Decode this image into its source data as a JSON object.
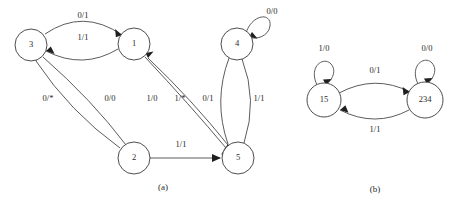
{
  "figure": {
    "background_color": "#ffffff",
    "stroke_color": "#4a4a4a",
    "text_color": "#2b2b2b"
  },
  "panels": [
    {
      "id": "panel-a",
      "caption": "(a)",
      "caption_x": 163,
      "caption_y": 188,
      "nodes": [
        {
          "id": "n3",
          "label": "3",
          "cx": 31,
          "cy": 45,
          "r": 16
        },
        {
          "id": "n1",
          "label": "1",
          "cx": 134,
          "cy": 44,
          "r": 16
        },
        {
          "id": "n4",
          "label": "4",
          "cx": 237,
          "cy": 44,
          "r": 16
        },
        {
          "id": "n2",
          "label": "2",
          "cx": 134,
          "cy": 158,
          "r": 16
        },
        {
          "id": "n5",
          "label": "5",
          "cx": 238,
          "cy": 158,
          "r": 16
        }
      ],
      "edges": [
        {
          "id": "e-3-1-top",
          "from": "3",
          "to": "1",
          "label": "0/1",
          "label_x": 83,
          "label_y": 16
        },
        {
          "id": "e-1-3-mid",
          "from": "1",
          "to": "3",
          "label": "1/1",
          "label_x": 83,
          "label_y": 38
        },
        {
          "id": "e-2-3",
          "from": "2",
          "to": "3",
          "label": "0/*",
          "label_x": 48,
          "label_y": 99
        },
        {
          "id": "e-3-2",
          "from": "3",
          "to": "2",
          "label": "0/0",
          "label_x": 110,
          "label_y": 99
        },
        {
          "id": "e-1-5",
          "from": "1",
          "to": "5",
          "label": "1/0",
          "label_x": 152,
          "label_y": 99
        },
        {
          "id": "e-5-1",
          "from": "5",
          "to": "1",
          "label": "1/*",
          "label_x": 180,
          "label_y": 99
        },
        {
          "id": "e-4-5-left",
          "from": "4",
          "to": "5",
          "label": "0/1",
          "label_x": 208,
          "label_y": 99
        },
        {
          "id": "e-5-4-right",
          "from": "5",
          "to": "4",
          "label": "1/1",
          "label_x": 259,
          "label_y": 99
        },
        {
          "id": "e-2-5",
          "from": "2",
          "to": "5",
          "label": "1/1",
          "label_x": 181,
          "label_y": 145
        },
        {
          "id": "e-4-4-self",
          "from": "4",
          "to": "4",
          "label": "0/0",
          "label_x": 272,
          "label_y": 12
        }
      ]
    },
    {
      "id": "panel-b",
      "caption": "(b)",
      "caption_x": 375,
      "caption_y": 190,
      "nodes": [
        {
          "id": "n15",
          "label": "15",
          "cx": 324,
          "cy": 100,
          "r": 17
        },
        {
          "id": "n234",
          "label": "234",
          "cx": 425,
          "cy": 100,
          "r": 18
        }
      ],
      "edges": [
        {
          "id": "e-15-15-self",
          "from": "15",
          "to": "15",
          "label": "1/0",
          "label_x": 324,
          "label_y": 49
        },
        {
          "id": "e-234-234-self",
          "from": "234",
          "to": "234",
          "label": "0/0",
          "label_x": 427,
          "label_y": 49
        },
        {
          "id": "e-15-234",
          "from": "15",
          "to": "234",
          "label": "0/1",
          "label_x": 375,
          "label_y": 71
        },
        {
          "id": "e-234-15",
          "from": "234",
          "to": "15",
          "label": "1/1",
          "label_x": 375,
          "label_y": 130
        }
      ]
    }
  ]
}
